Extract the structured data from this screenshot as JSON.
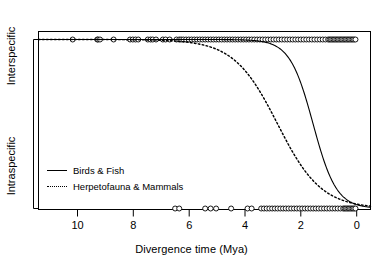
{
  "chart_data": {
    "type": "line",
    "title": "",
    "xlabel": "Divergence time (Mya)",
    "ylabel": "",
    "xlim": [
      11.6,
      -0.55
    ],
    "xticks": [
      10,
      8,
      6,
      4,
      2,
      0
    ],
    "xticklabels": [
      "10",
      "8",
      "6",
      "4",
      "2",
      "0"
    ],
    "x_axis_reversed": true,
    "yticks": [
      1,
      0
    ],
    "yticklabels": [
      "Interspecific",
      "Intraspecific"
    ],
    "ylim": [
      -0.06,
      1.06
    ],
    "grid": false,
    "legend_position": "lower left",
    "series": [
      {
        "name": "Birds & Fish",
        "linestyle": "solid",
        "color": "#000000",
        "model": "logistic",
        "midpoint_mya": 1.55,
        "slope": 2.35,
        "x": [
          11.6,
          10.0,
          8.0,
          6.0,
          5.0,
          4.5,
          4.0,
          3.7,
          3.4,
          3.1,
          2.8,
          2.5,
          2.2,
          2.0,
          1.8,
          1.55,
          1.3,
          1.1,
          0.9,
          0.7,
          0.5,
          0.3,
          0.1,
          -0.1,
          -0.3,
          -0.55
        ],
        "y": [
          1.0,
          1.0,
          1.0,
          0.999,
          0.9997,
          0.9993,
          0.998,
          0.996,
          0.992,
          0.984,
          0.968,
          0.937,
          0.879,
          0.817,
          0.729,
          0.5,
          0.281,
          0.163,
          0.089,
          0.047,
          0.024,
          0.012,
          0.006,
          0.003,
          0.0015,
          0.0006
        ]
      },
      {
        "name": "Herpetofauna & Mammals",
        "linestyle": "dotted",
        "color": "#000000",
        "model": "logistic",
        "midpoint_mya": 2.85,
        "slope": 1.25,
        "x": [
          11.6,
          10.0,
          8.0,
          6.5,
          6.0,
          5.5,
          5.0,
          4.6,
          4.2,
          3.8,
          3.4,
          3.1,
          2.85,
          2.6,
          2.3,
          2.0,
          1.7,
          1.4,
          1.1,
          0.8,
          0.5,
          0.2,
          -0.1,
          -0.55
        ],
        "y": [
          1.0,
          0.99998,
          0.9998,
          0.9912,
          0.9797,
          0.9629,
          0.937,
          0.9066,
          0.8593,
          0.7899,
          0.6966,
          0.6069,
          0.5,
          0.4221,
          0.3069,
          0.2166,
          0.1489,
          0.1007,
          0.0671,
          0.0443,
          0.029,
          0.0189,
          0.0123,
          0.0058
        ]
      }
    ],
    "rug_interspecific": {
      "y_value": 1,
      "marker": "open-circle",
      "points": [
        10.35,
        9.45,
        9.42,
        9.35,
        8.85,
        8.25,
        8.15,
        8.05,
        7.95,
        7.6,
        7.5,
        7.42,
        7.3,
        7.05,
        6.95,
        6.8,
        6.55,
        6.45,
        6.38,
        6.3,
        6.2,
        6.1,
        6.0,
        5.9,
        5.8,
        5.7,
        5.6,
        5.5,
        5.4,
        5.3,
        5.2,
        5.1,
        5.0,
        4.9,
        4.8,
        4.7,
        4.6,
        4.5,
        4.4,
        4.3,
        4.2,
        4.1,
        4.0,
        3.9,
        3.8,
        3.7,
        3.6,
        3.5,
        3.4,
        3.3,
        3.2,
        3.1,
        3.0,
        2.9,
        2.8,
        2.7,
        2.6,
        2.5,
        2.4,
        2.3,
        2.2,
        2.1,
        2.0,
        1.9,
        1.8,
        1.7,
        1.6,
        1.5,
        1.4,
        1.3,
        1.2,
        1.1,
        1.0,
        0.95,
        0.9,
        0.85,
        0.8,
        0.75,
        0.7,
        0.65,
        0.6,
        0.55,
        0.5,
        0.45,
        0.4,
        0.35,
        0.3,
        0.25,
        0.2,
        0.15,
        0.1,
        0.05,
        0.0
      ]
    },
    "rug_intraspecific": {
      "y_value": 0,
      "marker": "open-circle",
      "points": [
        6.6,
        6.45,
        5.5,
        5.3,
        5.1,
        4.55,
        3.95,
        3.8,
        3.45,
        3.35,
        3.25,
        3.15,
        3.05,
        2.95,
        2.85,
        2.75,
        2.65,
        2.55,
        2.45,
        2.35,
        2.25,
        2.15,
        2.05,
        1.95,
        1.85,
        1.75,
        1.65,
        1.55,
        1.45,
        1.35,
        1.25,
        1.15,
        1.05,
        0.95,
        0.85,
        0.75,
        0.65,
        0.55,
        0.45,
        0.4,
        0.35,
        0.3,
        0.25,
        0.2,
        0.15,
        0.1,
        0.05,
        0.0
      ]
    }
  },
  "axes": {
    "x_title": "Divergence time (Mya)",
    "y_label_top": "Interspecific",
    "y_label_bottom": "Intraspecific",
    "tick_0": "0",
    "tick_2": "2",
    "tick_4": "4",
    "tick_6": "6",
    "tick_8": "8",
    "tick_10": "10"
  },
  "legend": {
    "items": [
      {
        "label": "Birds & Fish",
        "style": "solid"
      },
      {
        "label": "Herpetofauna & Mammals",
        "style": "dotted"
      }
    ]
  }
}
